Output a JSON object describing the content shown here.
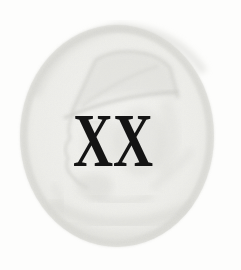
{
  "page": {
    "paper_color": "#fdfdfc"
  },
  "chapter_heading": {
    "numeral": "XX",
    "ink_color": "#141414"
  },
  "watermark": {
    "label": "engraved-portrait-medallion",
    "subject": "faint stippled engraving of a man in a cap, profile facing left, inside a circular medallion",
    "medallion_fill": "#efefeb",
    "rim_tone": "#d5d5d0",
    "figure_tone": "#d6d6d1",
    "line_tone": "#c9c9c4"
  }
}
